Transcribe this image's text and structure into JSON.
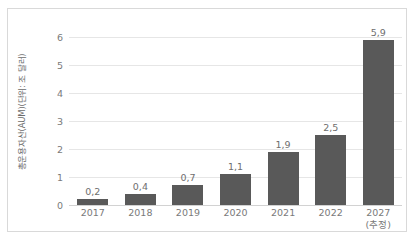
{
  "chart_data": {
    "type": "bar",
    "title": "",
    "subtitle": "",
    "xlabel": "",
    "ylabel": "총운용자산(AUM)(단위: 조 달러)",
    "categories": [
      "2017",
      "2018",
      "2019",
      "2020",
      "2021",
      "2022",
      "2027"
    ],
    "category_sublabels": [
      "",
      "",
      "",
      "",
      "",
      "",
      "(추정)"
    ],
    "values": [
      0.2,
      0.4,
      0.7,
      1.1,
      1.9,
      2.5,
      5.9
    ],
    "value_labels": [
      "0,2",
      "0,4",
      "0,7",
      "1,1",
      "1,9",
      "2,5",
      "5,9"
    ],
    "ylim": [
      0,
      6
    ],
    "yticks": [
      0,
      1,
      2,
      3,
      4,
      5,
      6
    ],
    "ytick_labels": [
      "0",
      "1",
      "2",
      "3",
      "4",
      "5",
      "6"
    ],
    "grid": true,
    "legend": false,
    "legend_position": "none",
    "series": [
      {
        "name": "총운용자산(AUM)",
        "values": [
          0.2,
          0.4,
          0.7,
          1.1,
          1.9,
          2.5,
          5.9
        ],
        "color": "#595959"
      }
    ],
    "colors": {
      "bar": "#595959",
      "gridline": "#e6e6e6",
      "axis": "#d2d2d2",
      "text": "#7a7a7a",
      "border": "#d9d9d9",
      "background": "#ffffff"
    }
  }
}
